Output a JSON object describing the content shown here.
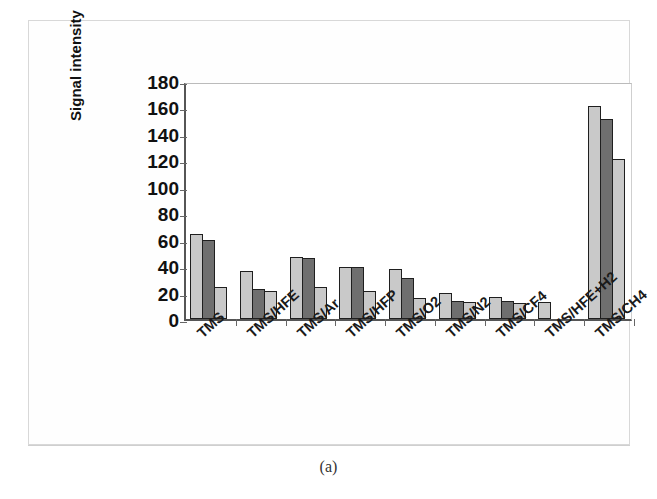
{
  "figure": {
    "caption": "(a)"
  },
  "chart_data": {
    "type": "bar",
    "title": "",
    "xlabel": "",
    "ylabel": "Signal intensity",
    "ylim": [
      0,
      180
    ],
    "ytick_step": 20,
    "yticks": [
      180,
      160,
      140,
      120,
      100,
      80,
      60,
      40,
      20,
      0
    ],
    "grid": false,
    "legend": "none",
    "categories": [
      "TMS",
      "TMS/HFE",
      "TMS/Ar",
      "TMS/HFP",
      "TMS/O2",
      "TMS/N2",
      "TMS/CF4",
      "TMS/HFE+H2",
      "TMS/CH4"
    ],
    "series": [
      {
        "name": "series-1",
        "color": "#c9c9c9",
        "values": [
          64,
          36,
          47,
          39,
          38,
          20,
          17,
          13,
          161
        ]
      },
      {
        "name": "series-2",
        "color": "#6f6f6f",
        "values": [
          60,
          23,
          46,
          39,
          31,
          14,
          14,
          null,
          151
        ]
      },
      {
        "name": "series-3",
        "color": "#c9c9c9",
        "values": [
          24,
          21,
          24,
          21,
          16,
          13,
          12,
          null,
          121
        ]
      }
    ]
  }
}
